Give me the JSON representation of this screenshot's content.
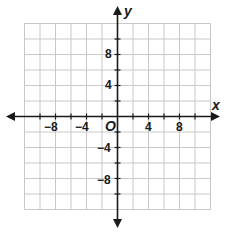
{
  "diagram": {
    "type": "coordinate-plane",
    "x_axis_label": "x",
    "y_axis_label": "y",
    "origin_label": "O",
    "grid": {
      "x_min": -12,
      "x_max": 12,
      "y_min": -12,
      "y_max": 12,
      "step": 2
    },
    "x_tick_labels": [
      "−8",
      "−4",
      "4",
      "8"
    ],
    "y_tick_labels": [
      "8",
      "4",
      "−4",
      "−8"
    ],
    "colors": {
      "grid": "#c8c8c8",
      "axis": "#1a1a1a",
      "background": "#ffffff"
    }
  }
}
